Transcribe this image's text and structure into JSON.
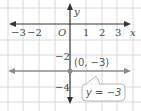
{
  "graph": {
    "x_axis_label": "x",
    "y_axis_label": "y",
    "origin_label": "O",
    "x_ticks": [
      {
        "label": "−3",
        "value": -3
      },
      {
        "label": "−2",
        "value": -2
      },
      {
        "label": "1",
        "value": 1
      },
      {
        "label": "2",
        "value": 2
      },
      {
        "label": "3",
        "value": 3
      }
    ],
    "y_ticks": [
      {
        "label": "−2",
        "value": -2
      },
      {
        "label": "−4",
        "value": -4
      }
    ],
    "point": {
      "label": "(0, −3)",
      "x": 0,
      "y": -3
    },
    "line_callout": "y = −3",
    "colors": {
      "grid": "#d8d8d8",
      "axis": "#333333",
      "line": "#8a8a8a",
      "point": "#8a8a8a",
      "callout_border": "#b5b5b5"
    }
  }
}
